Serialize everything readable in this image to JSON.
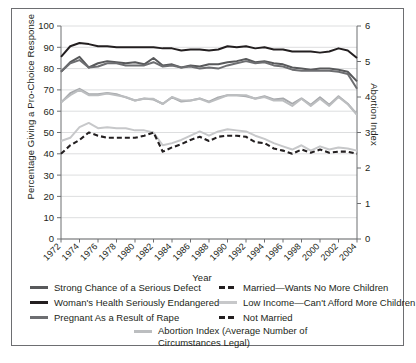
{
  "chart_data": {
    "type": "line",
    "title": "",
    "xlabel": "Year",
    "ylabel": "Percentage Giving a Pro-Choice Response",
    "ylabel_right": "Abortion Index",
    "ylim": [
      0,
      100
    ],
    "ylim_right": [
      0,
      6
    ],
    "yticks": [
      0,
      10,
      20,
      30,
      40,
      50,
      60,
      70,
      80,
      90,
      100
    ],
    "yticks_right": [
      0,
      1,
      2,
      3,
      4,
      5,
      6
    ],
    "grid": true,
    "legend_position": "below",
    "x": [
      1972,
      1973,
      1974,
      1975,
      1976,
      1977,
      1978,
      1979,
      1980,
      1981,
      1982,
      1983,
      1984,
      1985,
      1986,
      1987,
      1988,
      1989,
      1990,
      1991,
      1992,
      1993,
      1994,
      1995,
      1996,
      1997,
      1998,
      1999,
      2000,
      2001,
      2002,
      2003,
      2004
    ],
    "xticks": [
      1972,
      1974,
      1976,
      1978,
      1980,
      1982,
      1984,
      1986,
      1988,
      1990,
      1992,
      1994,
      1996,
      1998,
      2000,
      2002,
      2004
    ],
    "series": [
      {
        "name": "Strong Chance of a Serious Defect",
        "color": "#58595b",
        "style": "solid",
        "axis": "left",
        "values": [
          78.5,
          83.0,
          85.5,
          80.5,
          82.5,
          83.5,
          83.0,
          82.5,
          83.0,
          82.0,
          85.0,
          81.5,
          82.0,
          80.5,
          81.5,
          81.0,
          82.0,
          82.0,
          83.0,
          83.5,
          84.5,
          83.0,
          83.5,
          82.5,
          82.0,
          80.5,
          80.0,
          79.5,
          80.0,
          80.0,
          79.5,
          78.5,
          74.0
        ]
      },
      {
        "name": "Woman's Health Seriously Endangered",
        "color": "#231f20",
        "style": "solid",
        "axis": "left",
        "values": [
          85.5,
          90.5,
          92.0,
          91.5,
          90.5,
          90.5,
          90.0,
          90.0,
          90.0,
          90.0,
          90.0,
          89.5,
          89.5,
          88.5,
          89.0,
          89.0,
          88.5,
          89.0,
          90.5,
          90.0,
          90.5,
          89.5,
          90.0,
          89.0,
          89.0,
          88.0,
          88.0,
          88.0,
          87.5,
          88.0,
          89.5,
          88.5,
          85.0
        ]
      },
      {
        "name": "Pregnant As a Result of Rape",
        "color": "#6d6e71",
        "style": "solid",
        "axis": "left",
        "values": [
          78.5,
          82.5,
          84.0,
          80.5,
          81.0,
          82.5,
          82.5,
          81.5,
          81.5,
          81.5,
          83.0,
          81.0,
          81.5,
          80.5,
          81.0,
          80.0,
          80.5,
          80.0,
          81.5,
          82.5,
          83.5,
          82.5,
          83.0,
          81.5,
          81.0,
          79.5,
          79.0,
          79.0,
          79.0,
          79.0,
          78.5,
          77.5,
          70.5
        ]
      },
      {
        "name": "Low Income—Can't Afford More Children",
        "color": "#a7a9ac",
        "style": "solid",
        "axis": "left",
        "values": [
          64.0,
          68.5,
          70.5,
          68.0,
          68.0,
          68.5,
          68.0,
          66.5,
          65.0,
          66.0,
          65.5,
          63.5,
          66.5,
          64.5,
          65.0,
          66.0,
          64.5,
          66.5,
          67.5,
          67.5,
          67.0,
          66.0,
          67.0,
          65.5,
          66.0,
          63.5,
          66.0,
          63.0,
          66.5,
          63.0,
          67.0,
          63.5,
          58.5
        ]
      },
      {
        "name": "Married—Wants No More Children",
        "color": "#c7c8ca",
        "style": "solid",
        "axis": "left",
        "values": [
          46.0,
          47.5,
          52.5,
          54.5,
          52.0,
          52.5,
          52.0,
          52.0,
          51.0,
          51.0,
          50.0,
          44.0,
          45.0,
          46.5,
          48.5,
          50.5,
          48.5,
          50.5,
          51.5,
          51.0,
          50.5,
          48.5,
          47.0,
          45.0,
          43.5,
          42.0,
          44.0,
          41.5,
          43.5,
          42.0,
          43.0,
          42.5,
          41.5
        ]
      },
      {
        "name": "Not Married",
        "color": "#231f20",
        "style": "dashed",
        "axis": "left",
        "values": [
          40.0,
          44.0,
          46.5,
          50.0,
          48.5,
          47.5,
          47.5,
          47.5,
          47.5,
          48.5,
          50.0,
          41.0,
          43.0,
          44.5,
          46.5,
          48.0,
          46.0,
          48.0,
          48.5,
          48.5,
          48.0,
          45.5,
          45.0,
          42.5,
          41.5,
          40.0,
          42.0,
          40.5,
          42.0,
          40.5,
          41.0,
          41.0,
          40.0
        ]
      },
      {
        "name": "Abortion Index (Average Number of Circumstances Legal)",
        "color": "#bcbec0",
        "style": "solid",
        "axis": "right",
        "values": [
          3.85,
          4.05,
          4.2,
          4.05,
          4.05,
          4.1,
          4.05,
          4.0,
          3.9,
          3.95,
          3.95,
          3.8,
          4.0,
          3.9,
          3.9,
          3.95,
          3.85,
          3.95,
          4.05,
          4.05,
          4.05,
          3.95,
          4.0,
          3.9,
          3.9,
          3.75,
          3.95,
          3.75,
          3.95,
          3.75,
          4.0,
          3.8,
          3.5
        ]
      }
    ]
  },
  "legend": {
    "left_items": [
      {
        "label": "Strong Chance of a Serious Defect",
        "color": "#58595b",
        "style": "solid"
      },
      {
        "label": "Woman's Health Seriously Endangered",
        "color": "#231f20",
        "style": "solid"
      },
      {
        "label": "Pregnant As a Result of Rape",
        "color": "#6d6e71",
        "style": "solid"
      }
    ],
    "right_items": [
      {
        "label": "Married—Wants No More Children",
        "color": "#231f20",
        "style": "dashed"
      },
      {
        "label": "Low Income—Can't Afford More Children",
        "color": "#c7c8ca",
        "style": "solid"
      },
      {
        "label": "Not Married",
        "color": "#231f20",
        "style": "dashed"
      }
    ],
    "index_item": {
      "label_line1": "Abortion Index (Average Number of",
      "label_line2": "Circumstances Legal)",
      "color": "#bcbec0",
      "style": "solid"
    }
  }
}
